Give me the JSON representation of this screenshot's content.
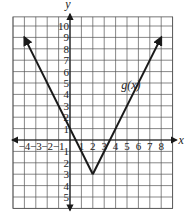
{
  "chart_data": {
    "type": "line",
    "title": "",
    "xlabel": "x",
    "ylabel": "y",
    "xlim": [
      -5,
      9
    ],
    "ylim": [
      -6,
      10.8
    ],
    "grid": true,
    "x_ticks": [
      "-4",
      "-3",
      "-2",
      "-1",
      "1",
      "2",
      "3",
      "4",
      "5",
      "6",
      "7",
      "8"
    ],
    "y_ticks": [
      "10",
      "9",
      "8",
      "7",
      "6",
      "5",
      "4",
      "3",
      "2",
      "1",
      "-1",
      "-2",
      "-3",
      "-4",
      "-5"
    ],
    "series": [
      {
        "name": "g(x)",
        "x": [
          -4,
          2,
          8
        ],
        "y": [
          9,
          -3,
          9
        ],
        "arrows_at_ends": true
      }
    ],
    "annotations": [
      {
        "text": "g(x)",
        "x": 5.2,
        "y": 4.5
      }
    ],
    "colors": {
      "line": "#1a1a1a",
      "grid": "#555555",
      "axis": "#1a1a1a"
    }
  }
}
